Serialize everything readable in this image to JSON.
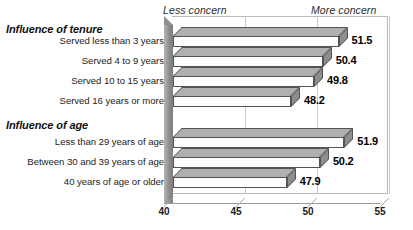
{
  "captions": {
    "less": "Less concern",
    "more": "More concern"
  },
  "groups": [
    {
      "heading": "Influence of tenure"
    },
    {
      "heading": "Influence of age"
    }
  ],
  "chart_data": {
    "type": "bar",
    "orientation": "horizontal",
    "title": "",
    "subtitle": "",
    "xlabel": "",
    "ylabel": "",
    "xlim": [
      40,
      55
    ],
    "ticks": [
      40,
      45,
      50,
      55
    ],
    "tick_labels": [
      "40",
      "45",
      "50",
      "55"
    ],
    "grid": true,
    "legend": false,
    "annotations": [
      "Less concern",
      "More concern"
    ],
    "groups": [
      {
        "name": "Influence of tenure",
        "categories": [
          "Served less than 3 years",
          "Served 4 to 9 years",
          "Served 10 to 15 years",
          "Served 16 years or more"
        ],
        "values": [
          51.5,
          50.4,
          49.8,
          48.2
        ],
        "value_labels": [
          "51.5",
          "50.4",
          "49.8",
          "48.2"
        ]
      },
      {
        "name": "Influence of age",
        "categories": [
          "Less than 29 years of age",
          "Between 30 and 39 years of age",
          "40 years of age or older"
        ],
        "values": [
          51.9,
          50.2,
          47.9
        ],
        "value_labels": [
          "51.9",
          "50.2",
          "47.9"
        ]
      }
    ],
    "categories": [
      "Served less than 3 years",
      "Served 4 to 9 years",
      "Served 10 to 15 years",
      "Served 16 years or more",
      "Less than 29 years of age",
      "Between 30 and 39 years of age",
      "40 years of age or older"
    ],
    "values": [
      51.5,
      50.4,
      49.8,
      48.2,
      51.9,
      50.2,
      47.9
    ]
  },
  "colors": {
    "bar_face": "#fdfdfd",
    "bar_top": "#b0b0b0",
    "bar_cap": "#8d8d8d",
    "outline": "#545454",
    "grid": "#c9c9c9",
    "wall": "#8f8f8f",
    "text": "#1a1a1a"
  }
}
